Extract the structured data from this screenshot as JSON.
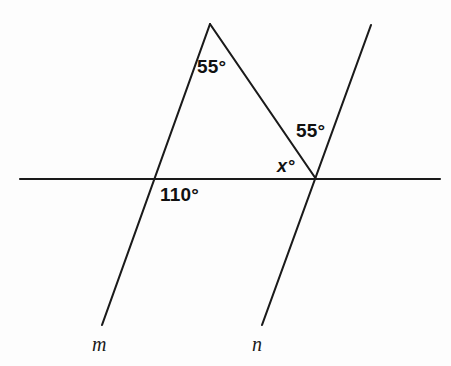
{
  "figure": {
    "kind": "geometry-diagram",
    "background_color": "#fdfdfd",
    "stroke_color": "#1a1a1a",
    "width": 451,
    "height": 366
  },
  "lines": {
    "horizontal": {
      "name": "horizontal-line",
      "x1": 20,
      "y1": 179,
      "x2": 440,
      "y2": 179
    },
    "line_m": {
      "name": "line-m",
      "x1": 210,
      "y1": 24,
      "x2": 102,
      "y2": 325
    },
    "line_n": {
      "name": "line-n",
      "x1": 371,
      "y1": 25,
      "x2": 262,
      "y2": 325
    },
    "apex_segment": {
      "name": "apex-to-intersection-segment",
      "x1": 210,
      "y1": 24,
      "x2": 316,
      "y2": 179
    }
  },
  "labels": {
    "angle_apex": {
      "text": "55°",
      "x": 197,
      "y": 57
    },
    "angle_right": {
      "text": "55°",
      "x": 296,
      "y": 121
    },
    "angle_x": {
      "text": "x°",
      "x": 277,
      "y": 157
    },
    "angle_110": {
      "text": "110°",
      "x": 160,
      "y": 185
    },
    "line_m_name": {
      "text": "m",
      "x": 92,
      "y": 334
    },
    "line_n_name": {
      "text": "n",
      "x": 252,
      "y": 334
    }
  }
}
